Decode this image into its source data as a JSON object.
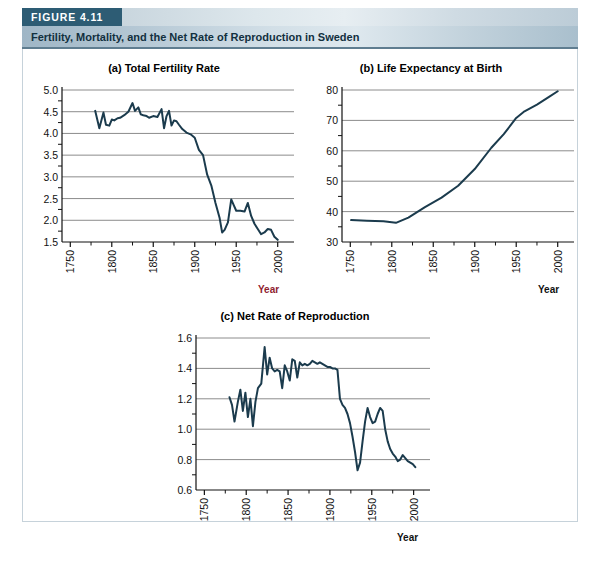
{
  "header": {
    "figure_tab": "FIGURE 4.11",
    "caption": "Fertility, Mortality, and the Net Rate of Reproduction in Sweden"
  },
  "colors": {
    "line": "#1b3b4d",
    "gridline": "#7f7f7f",
    "axis": "#111111",
    "year_label_a": "#8f2230",
    "year_label_bc": "#111111",
    "banner_tab": "#2d5c74"
  },
  "panels": [
    {
      "key": "a",
      "title": "(a) Total Fertility Rate",
      "xlabel": "Year",
      "xlabel_color": "#8f2230"
    },
    {
      "key": "b",
      "title": "(b) Life Expectancy at Birth",
      "xlabel": "Year",
      "xlabel_color": "#111111"
    },
    {
      "key": "c",
      "title": "(c) Net Rate of Reproduction",
      "xlabel": "Year",
      "xlabel_color": "#111111"
    }
  ],
  "chart_data": [
    {
      "type": "line",
      "panel": "a",
      "title": "(a) Total Fertility Rate",
      "xlabel": "Year",
      "ylabel": "",
      "xlim": [
        1740,
        2010
      ],
      "ylim": [
        1.5,
        5.0
      ],
      "xticks": [
        1750,
        1800,
        1850,
        1900,
        1950,
        2000
      ],
      "yticks": [
        1.5,
        2.0,
        2.5,
        3.0,
        3.5,
        4.0,
        4.5,
        5.0
      ],
      "ytick_labels": [
        "1.5",
        "2.0",
        "2.5",
        "3.0",
        "3.5",
        "4.0",
        "4.5",
        "5.0"
      ],
      "xtick_labels": [
        "1750",
        "1800",
        "1850",
        "1900",
        "1950",
        "2000"
      ],
      "grid": true,
      "minor_xticks": [
        1775,
        1825,
        1875,
        1925,
        1975
      ],
      "series": [
        {
          "name": "Total Fertility Rate",
          "x": [
            1780,
            1785,
            1790,
            1793,
            1797,
            1800,
            1803,
            1807,
            1810,
            1815,
            1820,
            1825,
            1828,
            1832,
            1835,
            1838,
            1842,
            1845,
            1850,
            1855,
            1860,
            1863,
            1866,
            1869,
            1872,
            1875,
            1878,
            1881,
            1885,
            1890,
            1895,
            1900,
            1905,
            1910,
            1915,
            1920,
            1925,
            1930,
            1933,
            1936,
            1940,
            1944,
            1947,
            1950,
            1955,
            1960,
            1964,
            1968,
            1972,
            1976,
            1980,
            1984,
            1988,
            1992,
            1996,
            2000
          ],
          "y": [
            4.52,
            4.12,
            4.48,
            4.2,
            4.18,
            4.32,
            4.3,
            4.35,
            4.36,
            4.42,
            4.5,
            4.7,
            4.52,
            4.6,
            4.44,
            4.42,
            4.4,
            4.36,
            4.4,
            4.38,
            4.56,
            4.12,
            4.4,
            4.52,
            4.18,
            4.3,
            4.28,
            4.2,
            4.1,
            4.02,
            3.98,
            3.9,
            3.62,
            3.5,
            3.05,
            2.8,
            2.4,
            2.05,
            1.72,
            1.78,
            1.95,
            2.48,
            2.35,
            2.22,
            2.22,
            2.2,
            2.4,
            2.1,
            1.92,
            1.8,
            1.68,
            1.72,
            1.8,
            1.78,
            1.62,
            1.55
          ]
        }
      ]
    },
    {
      "type": "line",
      "panel": "b",
      "title": "(b) Life Expectancy at Birth",
      "xlabel": "Year",
      "ylabel": "",
      "xlim": [
        1740,
        2010
      ],
      "ylim": [
        30,
        80
      ],
      "xticks": [
        1750,
        1800,
        1850,
        1900,
        1950,
        2000
      ],
      "yticks": [
        30,
        40,
        50,
        60,
        70,
        80
      ],
      "ytick_labels": [
        "30",
        "40",
        "50",
        "60",
        "70",
        "80"
      ],
      "xtick_labels": [
        "1750",
        "1800",
        "1850",
        "1900",
        "1950",
        "2000"
      ],
      "grid": true,
      "minor_xticks": [
        1775,
        1825,
        1875,
        1925,
        1975
      ],
      "series": [
        {
          "name": "Life Expectancy at Birth",
          "x": [
            1751,
            1770,
            1790,
            1805,
            1820,
            1840,
            1860,
            1880,
            1900,
            1920,
            1935,
            1950,
            1960,
            1975,
            1990,
            2000
          ],
          "y": [
            37.2,
            37.0,
            36.8,
            36.3,
            38.0,
            41.5,
            44.6,
            48.5,
            54.0,
            61.0,
            65.5,
            70.8,
            73.0,
            75.2,
            77.8,
            79.6
          ]
        }
      ]
    },
    {
      "type": "line",
      "panel": "c",
      "title": "(c) Net Rate of Reproduction",
      "xlabel": "Year",
      "ylabel": "",
      "xlim": [
        1740,
        2010
      ],
      "ylim": [
        0.6,
        1.6
      ],
      "xticks": [
        1750,
        1800,
        1850,
        1900,
        1950,
        2000
      ],
      "yticks": [
        0.6,
        0.8,
        1.0,
        1.2,
        1.4,
        1.6
      ],
      "ytick_labels": [
        "0.6",
        "0.8",
        "1.0",
        "1.2",
        "1.4",
        "1.6"
      ],
      "xtick_labels": [
        "1750",
        "1800",
        "1850",
        "1900",
        "1950",
        "2000"
      ],
      "grid": true,
      "minor_xticks": [
        1775,
        1825,
        1875,
        1925,
        1975
      ],
      "series": [
        {
          "name": "Net Rate of Reproduction",
          "x": [
            1780,
            1783,
            1786,
            1790,
            1793,
            1796,
            1799,
            1802,
            1805,
            1808,
            1811,
            1814,
            1818,
            1822,
            1825,
            1828,
            1831,
            1834,
            1837,
            1840,
            1843,
            1846,
            1849,
            1852,
            1855,
            1858,
            1861,
            1864,
            1867,
            1870,
            1873,
            1876,
            1879,
            1882,
            1885,
            1888,
            1891,
            1894,
            1897,
            1900,
            1903,
            1906,
            1909,
            1912,
            1915,
            1918,
            1921,
            1924,
            1927,
            1930,
            1933,
            1936,
            1939,
            1942,
            1945,
            1948,
            1951,
            1954,
            1957,
            1960,
            1963,
            1966,
            1969,
            1972,
            1975,
            1978,
            1981,
            1984,
            1987,
            1990,
            1993,
            1996,
            1999,
            2002
          ],
          "y": [
            1.21,
            1.16,
            1.05,
            1.18,
            1.26,
            1.12,
            1.24,
            1.08,
            1.2,
            1.02,
            1.18,
            1.27,
            1.3,
            1.54,
            1.36,
            1.47,
            1.4,
            1.38,
            1.39,
            1.38,
            1.27,
            1.42,
            1.38,
            1.32,
            1.46,
            1.45,
            1.34,
            1.44,
            1.42,
            1.43,
            1.42,
            1.43,
            1.45,
            1.44,
            1.43,
            1.44,
            1.43,
            1.42,
            1.41,
            1.41,
            1.4,
            1.4,
            1.39,
            1.2,
            1.16,
            1.14,
            1.1,
            1.04,
            0.95,
            0.85,
            0.73,
            0.78,
            0.92,
            1.05,
            1.14,
            1.08,
            1.04,
            1.05,
            1.1,
            1.14,
            1.12,
            1.0,
            0.92,
            0.87,
            0.84,
            0.82,
            0.79,
            0.8,
            0.83,
            0.81,
            0.79,
            0.78,
            0.77,
            0.75
          ]
        }
      ]
    }
  ]
}
